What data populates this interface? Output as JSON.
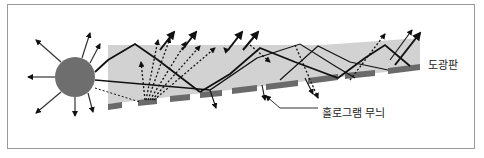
{
  "labels": {
    "light_guide_plate": "도광판",
    "hologram_pattern": "홀로그램 무늬"
  },
  "colors": {
    "frame_border": "#9a9a9a",
    "plate_fill": "#d2d2d2",
    "light_source": "#6e6e6e",
    "hologram_segment": "#6a6a6a",
    "ray": "#111111"
  },
  "elements": {
    "light_source": "circular light source emitting rays",
    "plate": "light guide plate (gray slanted panel)",
    "hologram": "dashed hologram pattern strip along plate bottom"
  }
}
